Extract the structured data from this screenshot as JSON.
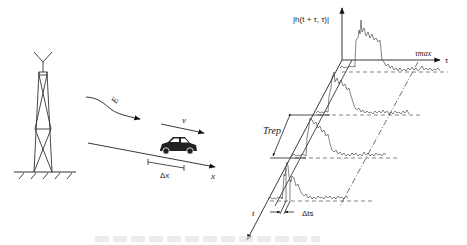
{
  "diagram": {
    "left_scene": {
      "tower": "transmitter-tower",
      "wave_label": "E",
      "velocity_label": "v",
      "displacement_label": "Δx",
      "axis_x_label": "x"
    },
    "right_plot": {
      "y_axis_label": "|h(t + τ, τ)|",
      "tau_axis_label": "τ",
      "tau_max_label": "τmax",
      "time_axis_label": "t",
      "repetition_label": "Trep",
      "sampling_label": "Δts",
      "traces": 4
    },
    "caption": ""
  }
}
